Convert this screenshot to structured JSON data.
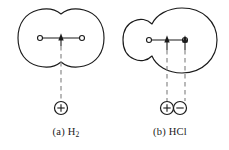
{
  "figure": {
    "type": "scientific-diagram",
    "background_color": "#ffffff",
    "line_color": "#1a1a1a",
    "dashed_color": "#8a8a8a",
    "width": 229,
    "height": 150
  },
  "panels": [
    {
      "id": "panel-a",
      "caption_prefix": "(a)",
      "molecule": "H",
      "molecule_subscript": "2",
      "caption_full": "(a) H2",
      "cloud_shape": "symmetric-two-lobe",
      "nuclei": [
        {
          "name": "nucleus-left",
          "cx": 40,
          "cy": 38
        },
        {
          "name": "nucleus-right",
          "cx": 82,
          "cy": 38
        }
      ],
      "bond_line": {
        "x1": 40,
        "y1": 38,
        "x2": 82,
        "y2": 38
      },
      "arrows": [
        {
          "name": "center-of-charge-arrow",
          "x": 61,
          "y_tip": 34,
          "y_base": 46
        }
      ],
      "dashed_lines": [
        {
          "x": 61,
          "y1": 46,
          "y2": 101
        }
      ],
      "charges": [
        {
          "name": "positive-charge",
          "symbol": "+",
          "cx": 61,
          "cy": 108,
          "r": 6.5
        }
      ]
    },
    {
      "id": "panel-b",
      "caption_prefix": "(b)",
      "molecule": "HCl",
      "molecule_subscript": "",
      "caption_full": "(b) HCl",
      "cloud_shape": "asymmetric-small-left-large-right",
      "nuclei": [
        {
          "name": "nucleus-left",
          "cx": 149,
          "cy": 40
        },
        {
          "name": "nucleus-right",
          "cx": 185,
          "cy": 40
        }
      ],
      "bond_line": {
        "x1": 149,
        "y1": 40,
        "x2": 185,
        "y2": 40
      },
      "arrows": [
        {
          "name": "positive-center-arrow",
          "x": 167,
          "y_tip": 36,
          "y_base": 50
        },
        {
          "name": "negative-center-arrow",
          "x": 185,
          "y_tip": 36,
          "y_base": 50
        }
      ],
      "dashed_lines": [
        {
          "x": 167,
          "y1": 50,
          "y2": 101
        },
        {
          "x": 185,
          "y1": 50,
          "y2": 101
        }
      ],
      "charges": [
        {
          "name": "positive-charge",
          "symbol": "+",
          "cx": 167,
          "cy": 108,
          "r": 6.5
        },
        {
          "name": "negative-charge",
          "symbol": "−",
          "cx": 180,
          "cy": 108,
          "r": 6.5
        }
      ]
    }
  ],
  "captions": {
    "panel_a_prefix": "(a) ",
    "panel_a_molecule": "H",
    "panel_a_sub": "2",
    "panel_b_text": "(b) HCl"
  }
}
